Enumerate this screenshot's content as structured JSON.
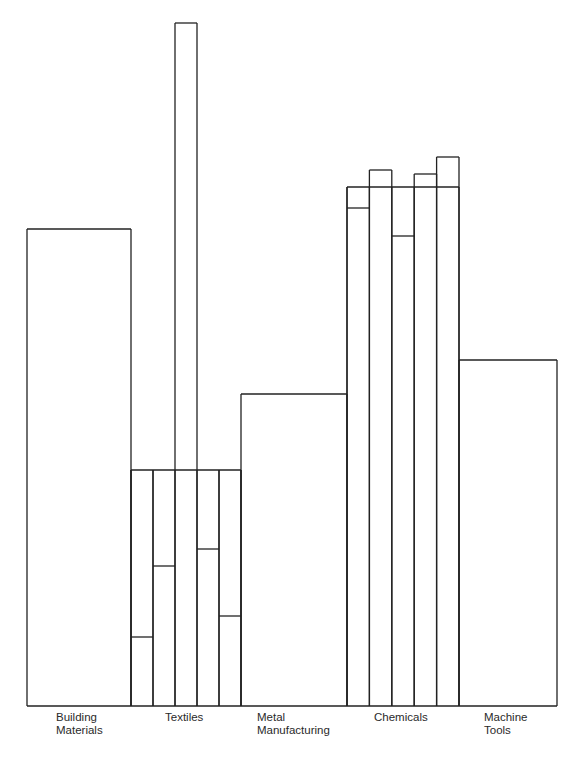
{
  "chart_data": {
    "type": "bar",
    "title": "",
    "xlabel": "",
    "ylabel": "",
    "grid": false,
    "legend": null,
    "categories": [
      "Building Materials",
      "Textiles",
      "Metal Manufacturing",
      "Chemicals",
      "Machine Tools"
    ],
    "values": [
      477,
      236,
      312,
      519,
      346
    ],
    "sub_bars": {
      "Textiles": [
        69,
        140,
        683,
        157,
        90
      ],
      "Chemicals": [
        498,
        536,
        470,
        532,
        549
      ]
    },
    "ylim": [
      0,
      700
    ]
  },
  "labels": {
    "building": "Building\nMaterials",
    "textiles": "Textiles",
    "metal": "Metal\nManufacturing",
    "chemicals": "Chemicals",
    "machine": "Machine\nTools"
  }
}
